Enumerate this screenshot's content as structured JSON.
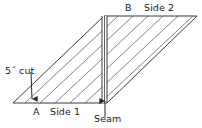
{
  "figure": {
    "background_color": "#ffffff",
    "line_color": "#3a3a3a",
    "hatch_color": "#6b6b6b",
    "text_color": "#1a1a1a"
  },
  "labels": {
    "cut": "5˝ cut",
    "a": "A",
    "side1": "Side 1",
    "seam": "Seam",
    "b": "B",
    "side2": "Side 2"
  },
  "shape": {
    "type": "parallelogram",
    "vertices": [
      {
        "name": "bottom-left",
        "x": 13,
        "y": 103
      },
      {
        "name": "bottom-right",
        "x": 107,
        "y": 103
      },
      {
        "name": "top-right",
        "x": 197,
        "y": 16
      },
      {
        "name": "top-left",
        "x": 104,
        "y": 16
      }
    ],
    "hatch_spacing": 15,
    "hatch_angle_deg": -43
  },
  "seam": {
    "x_left": 102,
    "x_right": 107,
    "y_top": 16,
    "y_bottom": 103
  },
  "arrows": [
    {
      "name": "cut-arrow",
      "from_x": 31,
      "from_y": 74,
      "to_x": 32,
      "to_y": 101,
      "direction": "down"
    },
    {
      "name": "seam-arrow",
      "from_x": 105,
      "from_y": 118,
      "to_x": 105,
      "to_y": 101,
      "direction": "up"
    }
  ]
}
